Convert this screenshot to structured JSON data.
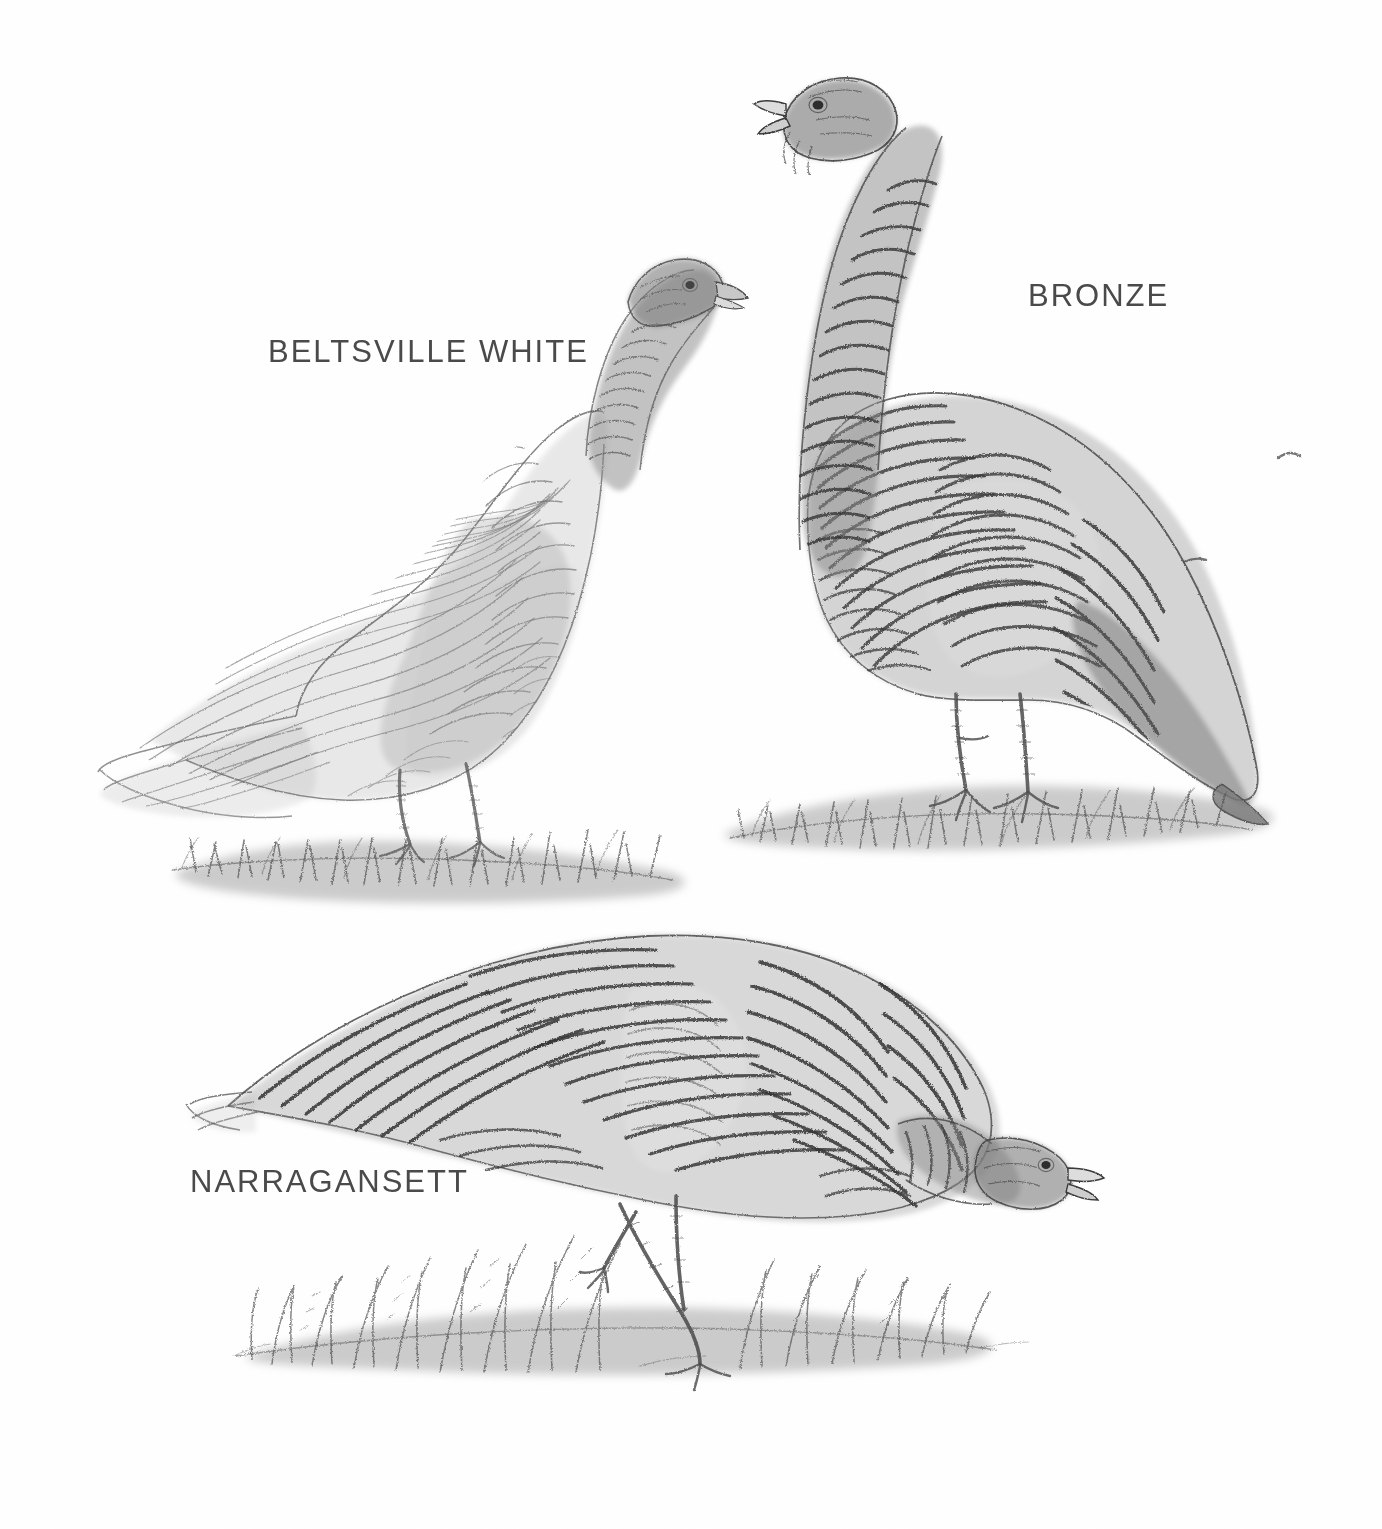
{
  "plate": {
    "title": "Turkey breeds illustration plate",
    "background_color": "#ffffff",
    "width": 1382,
    "height": 1529,
    "medium": "graphite pencil and grey ink wash drawing",
    "label_color": "#4a4a4a"
  },
  "labels": {
    "beltsville_white": "BELTSVILLE  WHITE",
    "bronze": "BRONZE",
    "narragansett": "NARRAGANSETT"
  },
  "subjects": [
    {
      "id": "beltsville-white",
      "label": "BELTSVILLE  WHITE",
      "pose": "standing, body in left profile, head raised and turned to the right",
      "plumage": "very pale, fine light-grey outlined barring on wing and body feathers, long pale tail trailing left",
      "ground": "grass tuft with grey wash shadow beneath the feet"
    },
    {
      "id": "bronze",
      "label": "BRONZE",
      "pose": "standing tall and upright, body in right profile, head high and beak open",
      "plumage": "dark, heavily barred neck and body, strongly contrasting dark wing bars, dark drooping tail to the lower right",
      "ground": "grass tuft with grey wash shadow beneath the feet"
    },
    {
      "id": "narragansett",
      "label": "NARRAGANSETT",
      "pose": "foraging, body in right profile, head lowered near the ground to the right",
      "plumage": "boldly barred black-and-grey wing and back feathers with pale crescent wing patch, tail pointing left",
      "ground": "tall grass blades with grey wash shadow beneath the feet"
    }
  ],
  "stray_marks": [
    {
      "id": "mark-right-upper",
      "x": 1285,
      "y": 455
    },
    {
      "id": "mark-right-lower",
      "x": 1190,
      "y": 560
    }
  ]
}
